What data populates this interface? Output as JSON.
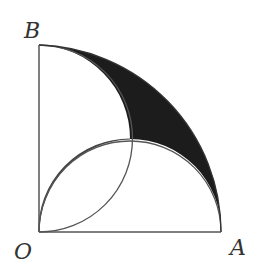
{
  "diagram": {
    "type": "geometry",
    "labels": {
      "O": "O",
      "A": "A",
      "B": "B"
    },
    "colors": {
      "stroke": "#555555",
      "lens_fill": "#cfcfcf",
      "crescent_fill": "#1c1c1c",
      "label": "#333333"
    }
  }
}
